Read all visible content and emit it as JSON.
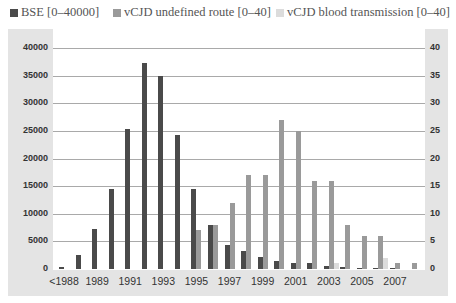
{
  "legend": [
    {
      "label": "BSE [0–40000]",
      "color": "#4a4a4a"
    },
    {
      "label": "vCJD undefined route [0–40]",
      "color": "#9a9a9a"
    },
    {
      "label": "vCJD blood transmission [0–40]",
      "color": "#dcdcdc"
    }
  ],
  "left_axis": [
    "40000",
    "35000",
    "30000",
    "25000",
    "20000",
    "15000",
    "10000",
    "5000",
    "0"
  ],
  "right_axis": [
    "40",
    "35",
    "30",
    "25",
    "20",
    "15",
    "10",
    "5",
    "0"
  ],
  "x_labels": [
    "<1988",
    "1989",
    "1991",
    "1993",
    "1995",
    "1997",
    "1999",
    "2001",
    "2003",
    "2005",
    "2007"
  ],
  "chart_data": {
    "type": "bar",
    "title": "",
    "xlabel": "",
    "ylabel": "",
    "categories": [
      "<1988",
      "1988",
      "1989",
      "1990",
      "1991",
      "1992",
      "1993",
      "1994",
      "1995",
      "1996",
      "1997",
      "1998",
      "1999",
      "2000",
      "2001",
      "2002",
      "2003",
      "2004",
      "2005",
      "2006",
      "2007",
      "2008"
    ],
    "tick_labels_shown": [
      "<1988",
      "1989",
      "1991",
      "1993",
      "1995",
      "1997",
      "1999",
      "2001",
      "2003",
      "2005",
      "2007"
    ],
    "series": [
      {
        "name": "BSE [0–40000]",
        "axis": "left",
        "color": "#4a4a4a",
        "values": [
          400,
          2500,
          7200,
          14400,
          25400,
          37200,
          34900,
          24200,
          14500,
          8000,
          4300,
          3200,
          2200,
          1400,
          1100,
          1100,
          550,
          350,
          200,
          100,
          50,
          0
        ]
      },
      {
        "name": "vCJD undefined route [0–40]",
        "axis": "right",
        "color": "#9a9a9a",
        "values": [
          0,
          0,
          0,
          0,
          0,
          0,
          0,
          0,
          7,
          8,
          12,
          17,
          17,
          27,
          25,
          16,
          16,
          8,
          6,
          6,
          1,
          1
        ]
      },
      {
        "name": "vCJD blood transmission [0–40]",
        "axis": "right",
        "color": "#dcdcdc",
        "values": [
          0,
          0,
          0,
          0,
          0,
          0,
          0,
          0,
          0,
          0,
          0,
          0,
          0,
          0,
          0,
          0,
          1,
          0,
          0,
          2,
          0,
          0
        ]
      }
    ],
    "left_ylim": [
      0,
      40000
    ],
    "right_ylim": [
      0,
      40
    ],
    "grid": true,
    "legend_position": "top"
  }
}
